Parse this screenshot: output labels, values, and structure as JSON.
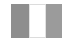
{
  "app": {
    "title": "Three Pane Layout",
    "width": 68,
    "height": 42,
    "background_color": "#ffffff"
  },
  "frame": {
    "name": "layout-frame",
    "x": 11,
    "y": 4,
    "width": 51,
    "height": 34,
    "background_color": "#f2f2f2"
  },
  "panes": [
    {
      "id": "left-pane",
      "label": "Left Pane",
      "color": "#8e8e8e",
      "width": 18,
      "state": "collapsed"
    },
    {
      "id": "center-pane",
      "label": "Center Pane",
      "color": "#ffffff",
      "border_color": "#e2e2e2",
      "width": 17,
      "state": "active"
    },
    {
      "id": "right-pane",
      "label": "Right Pane",
      "color": "#9b9b9b",
      "width": 16,
      "state": "collapsed"
    }
  ],
  "dividers": [
    {
      "id": "divider-left",
      "label": "Left Divider",
      "color": "#e2e2e2"
    },
    {
      "id": "divider-right",
      "label": "Right Divider",
      "color": "#e2e2e2"
    }
  ]
}
